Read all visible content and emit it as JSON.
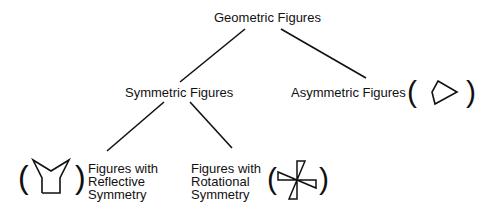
{
  "diagram": {
    "type": "tree",
    "root": {
      "label": "Geometric Figures"
    },
    "level1": [
      {
        "label": "Symmetric Figures"
      },
      {
        "label": "Asymmetric Figures",
        "example_icon": "irregular-pentagon"
      }
    ],
    "level2": [
      {
        "parent": "Symmetric Figures",
        "lines": [
          "Figures with",
          "Reflective",
          "Symmetry"
        ],
        "example_icon": "reflective-symmetric-shape"
      },
      {
        "parent": "Symmetric Figures",
        "lines": [
          "Figures with",
          "Rotational",
          "Symmetry"
        ],
        "example_icon": "pinwheel-shape"
      }
    ],
    "paren_open": "(",
    "paren_close": ")",
    "line_color": "#111111"
  }
}
